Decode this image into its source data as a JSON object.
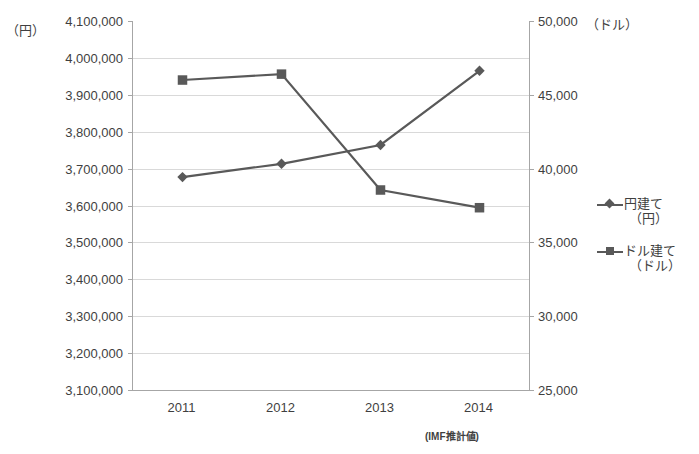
{
  "chart_data": {
    "type": "line",
    "title": "",
    "xlabel": "",
    "ylabel": "",
    "categories": [
      "2011",
      "2012",
      "2013",
      "2014"
    ],
    "grid": true,
    "legend_position": "right",
    "annotations": [
      "(IMF推計値)"
    ],
    "axes": {
      "left": {
        "unit_caption": "（円）",
        "ylim": [
          3100000,
          4100000
        ],
        "tick_step": 100000,
        "ticks": [
          "4,100,000",
          "4,000,000",
          "3,900,000",
          "3,800,000",
          "3,700,000",
          "3,600,000",
          "3,500,000",
          "3,400,000",
          "3,300,000",
          "3,200,000",
          "3,100,000"
        ],
        "tick_values": [
          4100000,
          4000000,
          3900000,
          3800000,
          3700000,
          3600000,
          3500000,
          3400000,
          3300000,
          3200000,
          3100000
        ]
      },
      "right": {
        "unit_caption": "（ドル）",
        "ylim": [
          25000,
          50000
        ],
        "tick_step": 5000,
        "ticks": [
          "50,000",
          "45,000",
          "40,000",
          "35,000",
          "30,000",
          "25,000"
        ],
        "tick_values": [
          50000,
          45000,
          40000,
          35000,
          30000,
          25000
        ]
      }
    },
    "series": [
      {
        "name": "円建て（円）",
        "legend_line1": "円建て",
        "legend_line2": "（円）",
        "marker": "diamond",
        "color": "#595959",
        "axis": "left",
        "values": [
          3677000,
          3713000,
          3764000,
          3965000
        ]
      },
      {
        "name": "ドル建て（ドル）",
        "legend_line1": "ドル建て",
        "legend_line2": "（ドル）",
        "marker": "square",
        "color": "#595959",
        "axis": "right",
        "values": [
          46000,
          46400,
          38550,
          37350
        ]
      }
    ]
  }
}
